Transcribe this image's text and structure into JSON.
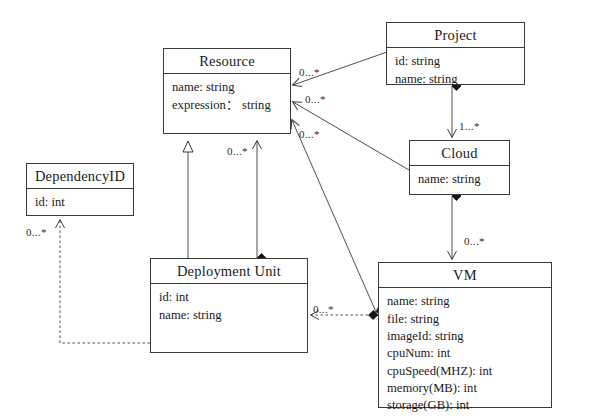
{
  "diagram": {
    "kind": "uml-class-diagram",
    "width": 591,
    "height": 420,
    "background": "#ffffff",
    "line_color": "#3a3a3a",
    "text_color": "#1a1a1a"
  },
  "classes": [
    {
      "id": "resource",
      "name": "Resource",
      "attributes": [
        "name: string",
        "expression：  string"
      ],
      "x": 163,
      "y": 48,
      "w": 128,
      "h": 86,
      "title_h": 27
    },
    {
      "id": "project",
      "name": "Project",
      "attributes": [
        "id: string",
        "name: string"
      ],
      "x": 386,
      "y": 22,
      "w": 139,
      "h": 63,
      "title_h": 26
    },
    {
      "id": "cloud",
      "name": "Cloud",
      "attributes": [
        "name: string"
      ],
      "x": 409,
      "y": 140,
      "w": 101,
      "h": 55,
      "title_h": 26
    },
    {
      "id": "dependencyid",
      "name": "DependencyID",
      "attributes": [
        "id: int"
      ],
      "x": 26,
      "y": 163,
      "w": 108,
      "h": 53,
      "title_h": 26
    },
    {
      "id": "deployment-unit",
      "name": "Deployment Unit",
      "attributes": [
        "id: int",
        "name: string"
      ],
      "x": 150,
      "y": 258,
      "w": 158,
      "h": 95,
      "title_h": 27
    },
    {
      "id": "vm",
      "name": "VM",
      "attributes": [
        "name: string",
        "file: string",
        "imageId: string",
        "cpuNum: int",
        "cpuSpeed(MHZ): int",
        "memory(MB): int",
        "storage(GB): int"
      ],
      "x": 378,
      "y": 262,
      "w": 174,
      "h": 146,
      "title_h": 27
    }
  ],
  "multiplicities": [
    {
      "id": "m-project-resource",
      "text": "0...*",
      "x": 299,
      "y": 66
    },
    {
      "id": "m-cloud-resource",
      "text": "0...*",
      "x": 305,
      "y": 93
    },
    {
      "id": "m-vm-resource",
      "text": "0...*",
      "x": 299,
      "y": 128
    },
    {
      "id": "m-resource-deployment",
      "text": "0...*",
      "x": 227,
      "y": 145
    },
    {
      "id": "m-project-cloud",
      "text": "1...*",
      "x": 459,
      "y": 120
    },
    {
      "id": "m-cloud-vm",
      "text": "0...*",
      "x": 464,
      "y": 235
    },
    {
      "id": "m-dependencyid",
      "text": "0...*",
      "x": 26,
      "y": 226
    },
    {
      "id": "m-deployment-vm",
      "text": "0...*",
      "x": 313,
      "y": 303
    }
  ],
  "edges": [
    {
      "id": "edge-project-resource",
      "from": "project",
      "to": "resource",
      "style": "solid",
      "source_marker": "filled-diamond",
      "target_marker": "open-arrow"
    },
    {
      "id": "edge-cloud-resource",
      "from": "cloud",
      "to": "resource",
      "style": "solid",
      "source_marker": "filled-diamond",
      "target_marker": "open-arrow"
    },
    {
      "id": "edge-vm-resource",
      "from": "vm",
      "to": "resource",
      "style": "solid",
      "source_marker": "filled-diamond",
      "target_marker": "open-arrow"
    },
    {
      "id": "edge-resource-generalization",
      "from": "deployment-unit",
      "to": "resource",
      "style": "solid",
      "target_marker": "hollow-triangle"
    },
    {
      "id": "edge-resource-deployment",
      "from": "deployment-unit",
      "to": "resource",
      "style": "solid",
      "source_marker": "filled-diamond",
      "target_marker": "open-arrow"
    },
    {
      "id": "edge-project-cloud",
      "from": "project",
      "to": "cloud",
      "style": "solid",
      "source_marker": "filled-diamond",
      "target_marker": "open-arrow"
    },
    {
      "id": "edge-cloud-vm",
      "from": "cloud",
      "to": "vm",
      "style": "solid",
      "source_marker": "filled-diamond",
      "target_marker": "open-arrow"
    },
    {
      "id": "edge-dependencyid-deployment",
      "from": "deployment-unit",
      "to": "dependencyid",
      "style": "dashed",
      "source_marker": "filled-diamond",
      "target_marker": "open-arrow"
    },
    {
      "id": "edge-vm-deployment",
      "from": "vm",
      "to": "deployment-unit",
      "style": "dashed",
      "source_marker": "filled-diamond",
      "target_marker": "open-arrow"
    }
  ]
}
